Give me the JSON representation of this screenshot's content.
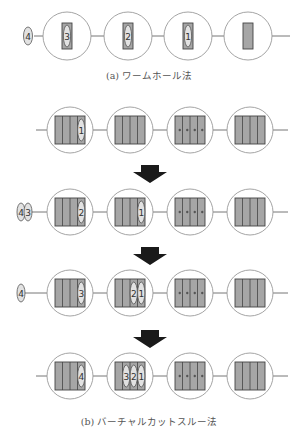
{
  "colors": {
    "line": "#777777",
    "circle": "#9a9a9a",
    "buffer_fill": "#a6a6a6",
    "buffer_stroke": "#444444",
    "token_fill": "#e2e2e2",
    "token_stroke": "#555555",
    "arrow": "#1a1a1a"
  },
  "captions": {
    "a": "(a) ワームホール法",
    "b": "(b) バーチャルカットスルー法"
  },
  "wormhole": {
    "y": 36,
    "nodes_x": [
      67,
      128,
      188,
      248
    ],
    "waiting_token": "4",
    "flits_in_nodes": [
      "3",
      "2",
      "1",
      ""
    ]
  },
  "virtual_cut_through": {
    "nodes_x": [
      70,
      130,
      190,
      250
    ],
    "steps": [
      {
        "y": 130,
        "waiting": [],
        "node_tokens": [
          [
            "1"
          ],
          [],
          [],
          []
        ],
        "third_node_dots": true
      },
      {
        "y": 212,
        "waiting": [
          "4",
          "3"
        ],
        "node_tokens": [
          [
            "2"
          ],
          [
            "1"
          ],
          [],
          []
        ],
        "third_node_dots": true
      },
      {
        "y": 293,
        "waiting": [
          "4"
        ],
        "node_tokens": [
          [
            "3"
          ],
          [
            "2",
            "1"
          ],
          [],
          []
        ],
        "third_node_dots": true
      },
      {
        "y": 376,
        "waiting": [],
        "node_tokens": [
          [
            "4"
          ],
          [
            "3",
            "2",
            "1"
          ],
          [],
          []
        ],
        "third_node_dots": true
      }
    ],
    "arrows_y": [
      165,
      247,
      330
    ]
  }
}
